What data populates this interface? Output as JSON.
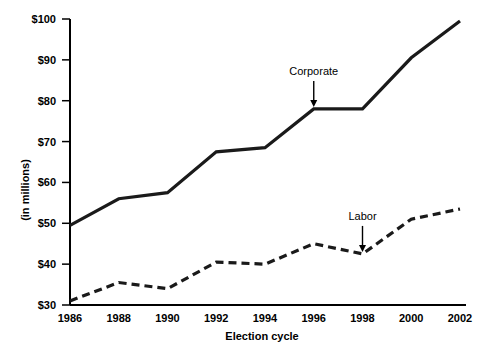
{
  "chart_data": {
    "type": "line",
    "title": "",
    "xlabel": "Election cycle",
    "ylabel": "(in millions)",
    "x": [
      1986,
      1988,
      1990,
      1992,
      1994,
      1996,
      1998,
      2000,
      2002
    ],
    "categories": [
      "1986",
      "1988",
      "1990",
      "1992",
      "1994",
      "1996",
      "1998",
      "2000",
      "2002"
    ],
    "xtick_labels": [
      "1986",
      "1988",
      "1990",
      "1992",
      "1994",
      "1996",
      "1998",
      "2000",
      "2002"
    ],
    "ytick_labels": [
      "$30",
      "$40",
      "$50",
      "$60",
      "$70",
      "$80",
      "$90",
      "$100"
    ],
    "ytick_values": [
      30,
      40,
      50,
      60,
      70,
      80,
      90,
      100
    ],
    "ylim": [
      30,
      100
    ],
    "xlim": [
      1986,
      2002
    ],
    "grid": false,
    "legend": "none",
    "series": [
      {
        "name": "Corporate",
        "style": "solid",
        "color": "#1a1a1a",
        "values": [
          49.5,
          56.0,
          57.5,
          67.5,
          68.5,
          78.0,
          78.0,
          90.5,
          99.5
        ]
      },
      {
        "name": "Labor",
        "style": "dashed",
        "color": "#1a1a1a",
        "values": [
          31.0,
          35.5,
          34.0,
          40.5,
          40.0,
          45.0,
          42.5,
          51.0,
          53.5
        ]
      }
    ],
    "annotations": [
      {
        "text": "Corporate",
        "points_to_year": 1996,
        "points_to_value": 78.0
      },
      {
        "text": "Labor",
        "points_to_year": 1998,
        "points_to_value": 42.5
      }
    ]
  }
}
